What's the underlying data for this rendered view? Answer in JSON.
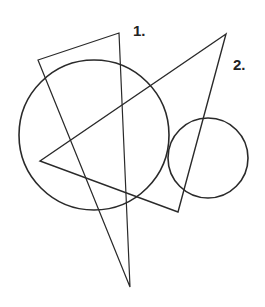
{
  "labels": {
    "one": "1.",
    "two": "2."
  },
  "shapes": {
    "triangle_1": [
      [
        38,
        60
      ],
      [
        119,
        33
      ],
      [
        130,
        287
      ]
    ],
    "triangle_2": [
      [
        226,
        34
      ],
      [
        40,
        161
      ],
      [
        178,
        212
      ]
    ],
    "large_circle": {
      "cx": 94,
      "cy": 135,
      "r": 75
    },
    "small_circle": {
      "cx": 208,
      "cy": 158,
      "r": 40
    }
  },
  "colors": {
    "stroke": "#2a2a2a",
    "background": "#ffffff"
  }
}
